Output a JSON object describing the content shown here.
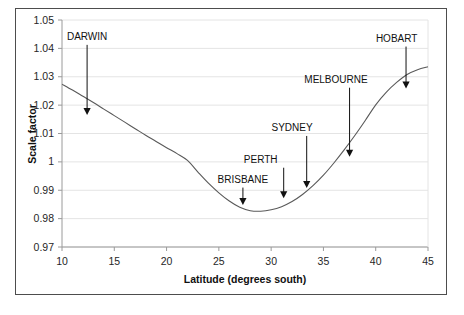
{
  "chart_data": {
    "type": "line",
    "title": "",
    "xlabel": "Latitude (degrees south)",
    "ylabel": "Scale factor",
    "xlim": [
      10,
      45
    ],
    "ylim": [
      0.97,
      1.05
    ],
    "xticks": [
      "10",
      "15",
      "20",
      "25",
      "30",
      "35",
      "40",
      "45"
    ],
    "xtick_values": [
      10,
      15,
      20,
      25,
      30,
      35,
      40,
      45
    ],
    "yticks": [
      "1.05",
      "1.04",
      "1.03",
      "1.02",
      "1.01",
      "1",
      "0.99",
      "0.98",
      "0.97"
    ],
    "ytick_values": [
      1.05,
      1.04,
      1.03,
      1.02,
      1.01,
      1.0,
      0.99,
      0.98,
      0.97
    ],
    "grid": "horizontal",
    "legend": "none",
    "line_color": "#595959",
    "series": [
      {
        "name": "Scale factor",
        "x": [
          10,
          11,
          12,
          13,
          14,
          15,
          16,
          17,
          18,
          19,
          20,
          21,
          22,
          23,
          24,
          25,
          26,
          27,
          28,
          29,
          30,
          31,
          32,
          33,
          34,
          35,
          36,
          37,
          38,
          39,
          40,
          41,
          42,
          43,
          44,
          45
        ],
        "values": [
          1.0274,
          1.0253,
          1.0231,
          1.0209,
          1.0186,
          1.0163,
          1.014,
          1.0117,
          1.0094,
          1.0072,
          1.005,
          1.0029,
          1.0005,
          0.9964,
          0.9925,
          0.9891,
          0.9862,
          0.984,
          0.9828,
          0.9826,
          0.9831,
          0.9842,
          0.986,
          0.9885,
          0.9916,
          0.9953,
          0.9996,
          1.0043,
          1.0093,
          1.0146,
          1.0201,
          1.0245,
          1.028,
          1.0308,
          1.0325,
          1.0335
        ]
      }
    ],
    "minimum": {
      "x": 28.8,
      "y": 0.9826
    },
    "annotations": [
      {
        "label": "DARWIN",
        "latitude": 12.4,
        "scale_factor": 1.0159,
        "label_x": 12.4,
        "label_y": 1.043,
        "arrow_tip_y": 1.0165
      },
      {
        "label": "BRISBANE",
        "latitude": 27.3,
        "scale_factor": 0.9832,
        "label_x": 27.3,
        "label_y": 0.9927,
        "arrow_tip_y": 0.9848
      },
      {
        "label": "PERTH",
        "latitude": 31.2,
        "scale_factor": 0.985,
        "label_x": 29.0,
        "label_y": 0.9997,
        "arrow_tip_y": 0.9872
      },
      {
        "label": "SYDNEY",
        "latitude": 33.4,
        "scale_factor": 0.9886,
        "label_x": 32.0,
        "label_y": 1.0109,
        "arrow_tip_y": 0.9908
      },
      {
        "label": "MELBOURNE",
        "latitude": 37.5,
        "scale_factor": 1.006,
        "label_x": 36.2,
        "label_y": 1.0279,
        "arrow_tip_y": 1.0018
      },
      {
        "label": "HOBART",
        "latitude": 42.9,
        "scale_factor": 1.0304,
        "label_x": 42.0,
        "label_y": 1.0424,
        "arrow_tip_y": 1.0259
      }
    ]
  },
  "axes": {
    "x_title": "Latitude (degrees south)",
    "y_title": "Scale factor"
  },
  "colors": {
    "line": "#595959",
    "grid": "#e4e4e4",
    "axis": "#9a9a9a",
    "frame": "#4d4d4d",
    "text": "#262626",
    "arrow": "#111111"
  }
}
